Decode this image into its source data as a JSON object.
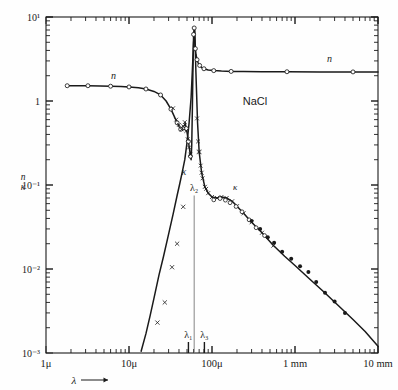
{
  "figure": {
    "material_label": "NaCl",
    "background": "#fefefe",
    "ink": "#1a1a1a"
  },
  "axes": {
    "x": {
      "title": "λ",
      "arrow": "⟶",
      "scale": "log",
      "range_um": [
        1,
        10000
      ],
      "tick_labels": [
        "1μ",
        "10μ",
        "100μ",
        "1 mm",
        "10 mm"
      ],
      "tick_values_um": [
        1,
        10,
        100,
        1000,
        10000
      ]
    },
    "y": {
      "title_top": "n",
      "title_bottom": "κ",
      "scale": "log",
      "range": [
        0.001,
        10
      ],
      "tick_labels": [
        "10¹",
        "1",
        "10⁻¹",
        "10⁻²",
        "10⁻³"
      ],
      "tick_values": [
        10,
        1,
        0.1,
        0.01,
        0.001
      ]
    }
  },
  "markers": {
    "lambda1": {
      "label": "λ₁",
      "x_um": 52
    },
    "lambda2": {
      "label": "λ₂",
      "x_um": 61
    },
    "lambda3": {
      "label": "λ₃",
      "x_um": 81
    }
  },
  "curve_labels": {
    "n_left": "n",
    "n_right": "n",
    "kappa_left": "κ",
    "kappa_right": "κ"
  },
  "chart_data": {
    "type": "line",
    "title": "NaCl",
    "xlabel": "λ",
    "ylabel": "n, κ",
    "xscale": "log",
    "yscale": "log",
    "xlim": [
      1,
      10000
    ],
    "ylim": [
      0.001,
      10
    ],
    "grid": false,
    "legend": "inline curve labels",
    "xunit": "μm",
    "series": [
      {
        "name": "n",
        "marker": "open-circle",
        "x": [
          1.8,
          2.4,
          3.2,
          4.5,
          6.0,
          8.0,
          10.0,
          13.0,
          16.0,
          20.0,
          24.0,
          28.0,
          32.0,
          35.0,
          38.0,
          40.0,
          42.0,
          44.0,
          46.0,
          47.5,
          49.0,
          50.5,
          52.0,
          53.5,
          55.0,
          56.0,
          57.0,
          58.0,
          59.0,
          60.0,
          61.0,
          62.0,
          63.0,
          64.0,
          66.0,
          68.0,
          71.0,
          75.0,
          80.0,
          90.0,
          105.0,
          130.0,
          170.0,
          240.0,
          400.0,
          800.0,
          2000.0,
          5000.0,
          10000.0
        ],
        "y": [
          1.52,
          1.52,
          1.52,
          1.51,
          1.5,
          1.49,
          1.47,
          1.44,
          1.39,
          1.3,
          1.18,
          1.0,
          0.8,
          0.66,
          0.55,
          0.5,
          0.46,
          0.45,
          0.48,
          0.55,
          0.47,
          0.4,
          0.33,
          0.27,
          0.22,
          0.2,
          0.3,
          0.8,
          2.5,
          6.2,
          7.4,
          5.5,
          4.2,
          3.6,
          3.1,
          2.85,
          2.65,
          2.5,
          2.42,
          2.34,
          2.3,
          2.27,
          2.25,
          2.24,
          2.23,
          2.23,
          2.22,
          2.22,
          2.22
        ]
      },
      {
        "name": "κ",
        "marker": "cross-and-dot",
        "x": [
          14.0,
          16.0,
          18.0,
          20.0,
          23.0,
          26.0,
          30.0,
          34.0,
          38.0,
          41.0,
          44.0,
          47.0,
          50.0,
          53.0,
          56.0,
          58.0,
          60.0,
          62.0,
          64.0,
          67.0,
          70.0,
          75.0,
          82.0,
          90.0,
          100.0,
          115.0,
          130.0,
          150.0,
          175.0,
          200.0,
          240.0,
          300.0,
          400.0,
          550.0,
          750.0,
          1000.0,
          1500.0,
          2200.0,
          3200.0,
          5000.0,
          7000.0,
          10000.0
        ],
        "y": [
          0.00105,
          0.0017,
          0.0028,
          0.0045,
          0.0085,
          0.014,
          0.026,
          0.045,
          0.075,
          0.105,
          0.145,
          0.2,
          0.32,
          0.55,
          1.1,
          2.3,
          5.0,
          7.0,
          2.2,
          0.55,
          0.25,
          0.14,
          0.095,
          0.08,
          0.072,
          0.07,
          0.072,
          0.07,
          0.064,
          0.056,
          0.046,
          0.036,
          0.027,
          0.019,
          0.0142,
          0.011,
          0.0076,
          0.0054,
          0.0038,
          0.0025,
          0.0018,
          0.0012
        ]
      }
    ],
    "annotations": [
      {
        "text": "NaCl",
        "x_um": 330,
        "y": 0.9
      },
      {
        "text": "n",
        "x_um": 6.5,
        "y": 1.85
      },
      {
        "text": "n",
        "x_um": 2600,
        "y": 2.95
      },
      {
        "text": "κ",
        "x_um": 47,
        "y": 0.135
      },
      {
        "text": "κ",
        "x_um": 190,
        "y": 0.074
      },
      {
        "text": "λ₁",
        "x_um": 52,
        "y": 0.0016
      },
      {
        "text": "λ₂",
        "x_um": 61,
        "y": 0.048
      },
      {
        "text": "λ₃",
        "x_um": 81,
        "y": 0.0016
      }
    ]
  }
}
